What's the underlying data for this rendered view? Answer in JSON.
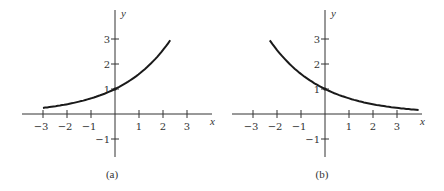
{
  "chart_data": [
    {
      "type": "line",
      "panel": "a",
      "caption": "(a)",
      "xlabel": "x",
      "ylabel": "y",
      "x_ticks": [
        -3,
        -2,
        -1,
        1,
        2,
        3
      ],
      "y_ticks": [
        -1,
        1,
        2,
        3
      ],
      "x_tick_labels": [
        "−3",
        "−2",
        "−1",
        "1",
        "2",
        "3"
      ],
      "y_tick_labels": [
        "−1",
        "1",
        "2",
        "3"
      ],
      "xlim": [
        -3.8,
        4
      ],
      "ylim": [
        -1.7,
        3.9
      ],
      "grid": false,
      "series": [
        {
          "name": "exponential growth",
          "x": [
            -3,
            -2,
            -1,
            0,
            1,
            2,
            2.3
          ],
          "y": [
            0.24,
            0.39,
            0.63,
            1.0,
            1.6,
            2.56,
            2.95
          ]
        }
      ]
    },
    {
      "type": "line",
      "panel": "b",
      "caption": "(b)",
      "xlabel": "x",
      "ylabel": "y",
      "x_ticks": [
        -3,
        -2,
        -1,
        1,
        2,
        3
      ],
      "y_ticks": [
        -1,
        1,
        2,
        3
      ],
      "x_tick_labels": [
        "−3",
        "−2",
        "−1",
        "1",
        "2",
        "3"
      ],
      "y_tick_labels": [
        "−1",
        "1",
        "2",
        "3"
      ],
      "xlim": [
        -3.8,
        4
      ],
      "ylim": [
        -1.7,
        3.9
      ],
      "grid": false,
      "series": [
        {
          "name": "exponential decay",
          "x": [
            -2.3,
            -2,
            -1,
            0,
            1,
            2,
            3,
            3.9
          ],
          "y": [
            2.95,
            2.56,
            1.6,
            1.0,
            0.63,
            0.39,
            0.24,
            0.16
          ]
        }
      ]
    }
  ],
  "panels": {
    "a": {
      "caption": "(a)",
      "x_axis_label": "x",
      "y_axis_label": "y"
    },
    "b": {
      "caption": "(b)",
      "x_axis_label": "x",
      "y_axis_label": "y"
    }
  }
}
